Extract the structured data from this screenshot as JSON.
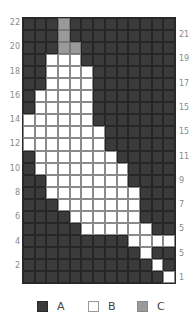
{
  "chart_data": {
    "type": "heatmap",
    "title": "",
    "columns": 13,
    "rows": 22,
    "row_order": "top-to-bottom (row 22 first)",
    "grid": [
      "AAACAAAAAAAAA",
      "AAACAAAAAAAAA",
      "AAACCAAAAAAAA",
      "AABBBAAAAAAAA",
      "AABBBBAAAAAAA",
      "AABBBBAAAAAAA",
      "ABBBBBAAAAAAA",
      "ABBBBBAAAAAAA",
      "BBBBBBAAAAAAA",
      "BBBBBBBAAAAAA",
      "BBBBBBBAAAAAA",
      "ABBBBBBBAAAAA",
      "ABBBBBBBBAAAA",
      "AABBBBBBBAAAA",
      "AABBBBBBBBAAA",
      "AAABBBBBBBAAA",
      "AAAABBBBBBAAA",
      "AAAAABBBBBBAA",
      "AAAAAAAAABBBB",
      "AAAAAAAAAABAA",
      "AAAAAAAAAAABA",
      "AAAAAAAAAAAAB"
    ],
    "left_labels": [
      {
        "row": 22,
        "text": "22"
      },
      {
        "row": 20,
        "text": "20"
      },
      {
        "row": 18,
        "text": "18"
      },
      {
        "row": 16,
        "text": "16"
      },
      {
        "row": 14,
        "text": "14"
      },
      {
        "row": 12,
        "text": "12"
      },
      {
        "row": 10,
        "text": "10"
      },
      {
        "row": 8,
        "text": "8"
      },
      {
        "row": 6,
        "text": "6"
      },
      {
        "row": 4,
        "text": "4"
      },
      {
        "row": 2,
        "text": "2"
      }
    ],
    "right_labels": [
      {
        "row": 21,
        "text": "21"
      },
      {
        "row": 19,
        "text": "19"
      },
      {
        "row": 17,
        "text": "17"
      },
      {
        "row": 15,
        "text": "15"
      },
      {
        "row": 13,
        "text": "15"
      },
      {
        "row": 11,
        "text": "11"
      },
      {
        "row": 9,
        "text": "9"
      },
      {
        "row": 7,
        "text": "7"
      },
      {
        "row": 5,
        "text": "5"
      },
      {
        "row": 3,
        "text": "5"
      },
      {
        "row": 1,
        "text": "1"
      }
    ],
    "legend": [
      {
        "key": "A",
        "label": "A",
        "color": "#3b3b3b"
      },
      {
        "key": "B",
        "label": "B",
        "color": "#ffffff"
      },
      {
        "key": "C",
        "label": "C",
        "color": "#9a9a9a"
      }
    ]
  },
  "legend": {
    "a_label": "A",
    "b_label": "B",
    "c_label": "C"
  }
}
